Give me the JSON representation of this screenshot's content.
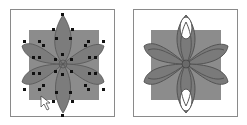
{
  "panels": [
    {
      "id": "left",
      "label": "editing-view",
      "state": "anchor points selected"
    },
    {
      "id": "right",
      "label": "result-view",
      "state": "path preview"
    }
  ],
  "colors": {
    "frame": "#8a8a8a",
    "square": "#8c8c8c",
    "petal": "#7a7a7a",
    "petal_stroke": "#5a5a5a",
    "anchor": "#111111",
    "background": "#ffffff"
  }
}
